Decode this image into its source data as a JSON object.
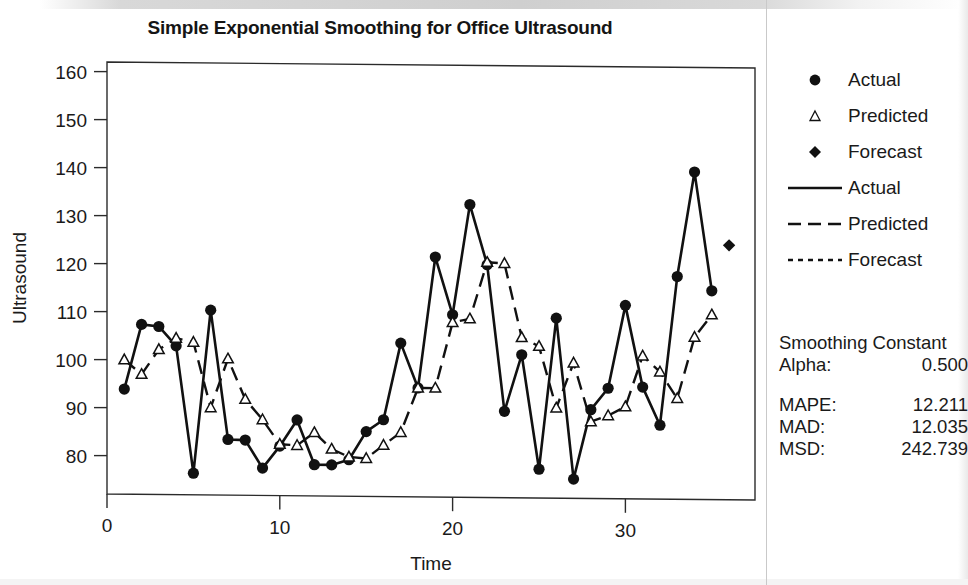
{
  "chart_data": {
    "type": "line",
    "title": "Simple Exponential Smoothing for Office Ultrasound",
    "xlabel": "Time",
    "ylabel": "Ultrasound",
    "xlim": [
      0,
      37.5
    ],
    "ylim": [
      72,
      162
    ],
    "xticks": [
      0,
      10,
      20,
      30
    ],
    "yticks": [
      80,
      90,
      100,
      110,
      120,
      130,
      140,
      150,
      160
    ],
    "grid": false,
    "legend_position": "right",
    "x": [
      1,
      2,
      3,
      4,
      5,
      6,
      7,
      8,
      9,
      10,
      11,
      12,
      13,
      14,
      15,
      16,
      17,
      18,
      19,
      20,
      21,
      22,
      23,
      24,
      25,
      26,
      27,
      28,
      29,
      30,
      31,
      32,
      33,
      34,
      35
    ],
    "series": [
      {
        "name": "Actual",
        "marker": "filled-circle",
        "line": "solid",
        "values": [
          93.9,
          107.4,
          107.0,
          103.0,
          76.5,
          110.5,
          83.6,
          83.5,
          77.7,
          82.3,
          87.8,
          78.5,
          78.5,
          79.6,
          85.5,
          88.0,
          104.0,
          94.7,
          122.0,
          110.0,
          133.0,
          120.5,
          90.0,
          101.8,
          78.0,
          109.5,
          76.0,
          90.5,
          95.0,
          112.3,
          95.3,
          87.4,
          118.4,
          140.2,
          115.5
        ]
      },
      {
        "name": "Predicted",
        "marker": "open-triangle",
        "line": "dashed",
        "values": [
          100.0,
          97.0,
          102.2,
          104.6,
          103.8,
          90.2,
          100.4,
          92.0,
          87.8,
          82.7,
          82.5,
          85.2,
          81.8,
          80.2,
          79.9,
          82.7,
          85.4,
          94.7,
          94.7,
          108.4,
          109.2,
          121.0,
          120.8,
          105.4,
          103.6,
          90.8,
          100.2,
          88.0,
          89.3,
          91.2,
          101.8,
          98.5,
          93.0,
          105.8,
          110.5
        ]
      }
    ],
    "forecast": {
      "name": "Forecast",
      "marker": "filled-diamond",
      "line": "dotted",
      "x": [
        36
      ],
      "values": [
        125.0
      ]
    }
  },
  "legend": {
    "items": [
      {
        "key": "filled-circle-marker",
        "label": "Actual"
      },
      {
        "key": "open-triangle-marker",
        "label": "Predicted"
      },
      {
        "key": "filled-diamond-marker",
        "label": "Forecast"
      },
      {
        "key": "solid-line",
        "label": "Actual"
      },
      {
        "key": "dashed-line",
        "label": "Predicted"
      },
      {
        "key": "dotted-line",
        "label": "Forecast"
      }
    ]
  },
  "stats": {
    "heading": "Smoothing Constant",
    "alpha_label": "Alpha:",
    "alpha_value": "0.500",
    "rows": [
      {
        "label": "MAPE:",
        "value": "12.211"
      },
      {
        "label": "MAD:",
        "value": "12.035"
      },
      {
        "label": "MSD:",
        "value": "242.739"
      }
    ]
  },
  "colors": {
    "ink": "#111111",
    "background": "#ffffff"
  }
}
